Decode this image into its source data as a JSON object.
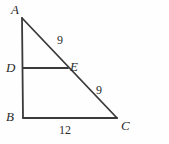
{
  "figure": {
    "type": "geometry-diagram",
    "background_color": "#fefefe",
    "stroke_color": "#3a3a3a",
    "text_color": "#2b2b2b"
  },
  "vertices": {
    "A": {
      "label": "A",
      "x": 22,
      "y": 18
    },
    "B": {
      "label": "B",
      "x": 23,
      "y": 118
    },
    "C": {
      "label": "C",
      "x": 117,
      "y": 118
    },
    "D": {
      "label": "D",
      "x": 23,
      "y": 68
    },
    "E": {
      "label": "E",
      "x": 68,
      "y": 68
    }
  },
  "segments": [
    {
      "name": "AB",
      "from": "A",
      "to": "B"
    },
    {
      "name": "BC",
      "from": "B",
      "to": "C"
    },
    {
      "name": "AC",
      "from": "A",
      "to": "C"
    },
    {
      "name": "DE",
      "from": "D",
      "to": "E"
    }
  ],
  "measures": {
    "AE": "9",
    "EC": "9",
    "BC": "12"
  },
  "chart_data": {
    "type": "diagram",
    "title": "",
    "points": [
      {
        "name": "A",
        "x": 22,
        "y": 18
      },
      {
        "name": "B",
        "x": 23,
        "y": 118
      },
      {
        "name": "C",
        "x": 117,
        "y": 118
      },
      {
        "name": "D",
        "x": 23,
        "y": 68
      },
      {
        "name": "E",
        "x": 68,
        "y": 68
      }
    ],
    "edges": [
      {
        "from": "A",
        "to": "B",
        "label": ""
      },
      {
        "from": "B",
        "to": "C",
        "label": "12"
      },
      {
        "from": "A",
        "to": "E",
        "label": "9"
      },
      {
        "from": "E",
        "to": "C",
        "label": "9"
      },
      {
        "from": "D",
        "to": "E",
        "label": ""
      }
    ]
  }
}
